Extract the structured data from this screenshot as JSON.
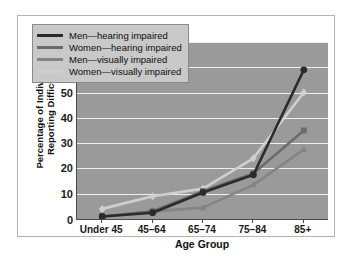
{
  "chart_data": {
    "type": "line",
    "title": "",
    "xlabel": "Age Group",
    "ylabel": "Percentage of Individuals Reporting Difficulty",
    "ylabel_line1": "Percentage of Individuals",
    "ylabel_line2": "Reporting Difficulty",
    "categories": [
      "Under 45",
      "45–64",
      "65–74",
      "75–84",
      "85+"
    ],
    "ylim": [
      0,
      70
    ],
    "ytick_step": 10,
    "yticks": [
      "70",
      "60",
      "50",
      "40",
      "30",
      "20",
      "10",
      "0"
    ],
    "ytick_values": [
      70,
      60,
      50,
      40,
      30,
      20,
      10,
      0
    ],
    "grid": "horizontal",
    "legend_position": "top-left",
    "plot_background": "#9a9a9a",
    "gridline_color": "#f0f0f0",
    "series": [
      {
        "name": "Men—hearing impaired",
        "label": "Men—hearing impaired",
        "color": "#2b2b2b",
        "marker": "circle",
        "values": [
          1,
          2.5,
          10.5,
          17.5,
          59
        ]
      },
      {
        "name": "Women—hearing impaired",
        "label": "Women—hearing impaired",
        "color": "#6b6b6b",
        "marker": "square",
        "values": [
          1,
          3,
          11,
          18,
          35
        ]
      },
      {
        "name": "Men—visually impaired",
        "label": "Men—visually impaired",
        "color": "#848484",
        "marker": "triangle",
        "values": [
          1,
          3,
          4.5,
          13.5,
          27.5
        ]
      },
      {
        "name": "Women—visually impaired",
        "label": "Women—visually impaired",
        "color": "#cfcfcf",
        "marker": "diamond",
        "values": [
          4,
          9,
          12,
          24,
          50
        ]
      }
    ]
  }
}
